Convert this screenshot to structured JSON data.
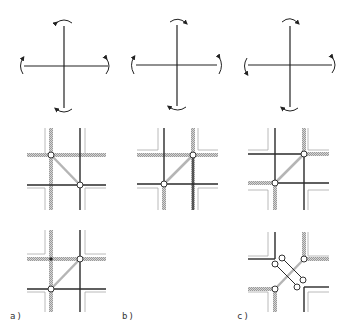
{
  "figure": {
    "columns": [
      {
        "id": "a",
        "label": "a)",
        "label_x": 10,
        "label_y": 311
      },
      {
        "id": "b",
        "label": "b)",
        "label_x": 122,
        "label_y": 311
      },
      {
        "id": "c",
        "label": "c)",
        "label_x": 237,
        "label_y": 311
      }
    ],
    "rotation_crosses": [
      {
        "column": "a",
        "cx": 64,
        "cy": 66,
        "arm": 42,
        "arrow_direction": "clockwise"
      },
      {
        "column": "b",
        "cx": 177,
        "cy": 64,
        "arm": 42,
        "arrow_direction": "clockwise"
      },
      {
        "column": "c",
        "cx": 290,
        "cy": 64,
        "arm": 42,
        "arrow_direction": "mixed"
      }
    ],
    "colors": {
      "solid_line": "#2a2a2a",
      "hatched_line": "#b8b8b8",
      "corner_line": "#a0a0a0",
      "node_fill": "#ffffff",
      "node_stroke": "#333333"
    }
  }
}
